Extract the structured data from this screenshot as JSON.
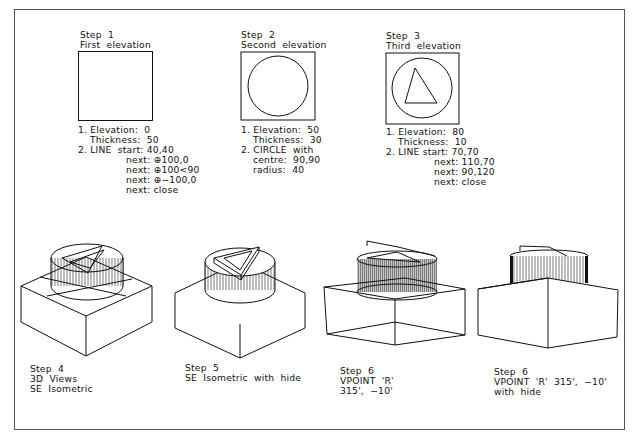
{
  "figure": {
    "steps_top": [
      {
        "title": "Step  1",
        "subtitle": "First  elevation",
        "notes": [
          "1. Elevation:  0",
          "Thickness:  50",
          "2. LINE  start: 40,40",
          "next: ⊕100,0",
          "next: ⊕100<90",
          "next: ⊕−100,0",
          "next: close"
        ]
      },
      {
        "title": "Step  2",
        "subtitle": "Second  elevation",
        "notes": [
          "1. Elevation:  50",
          "Thickness:  30",
          "2. CIRCLE  with",
          "centre:  90,90",
          "radius:  40"
        ]
      },
      {
        "title": "Step  3",
        "subtitle": "Third  elevation",
        "notes": [
          "1. Elevation:  80",
          "Thickness:  10",
          "2. LINE start: 70,70",
          "next: 110,70",
          "next: 90,120",
          "next: close"
        ]
      }
    ],
    "steps_bottom": [
      {
        "lines": [
          "Step  4",
          "3D  Views",
          "SE  Isometric"
        ]
      },
      {
        "lines": [
          "Step  5",
          "SE  Isometric  with  hide"
        ]
      },
      {
        "lines": [
          "Step  6",
          "VPOINT  'R'",
          "315',  −10'"
        ]
      },
      {
        "lines": [
          "Step  6",
          "VPOINT  'R'  315',  −10'",
          "with  hide"
        ]
      }
    ]
  }
}
